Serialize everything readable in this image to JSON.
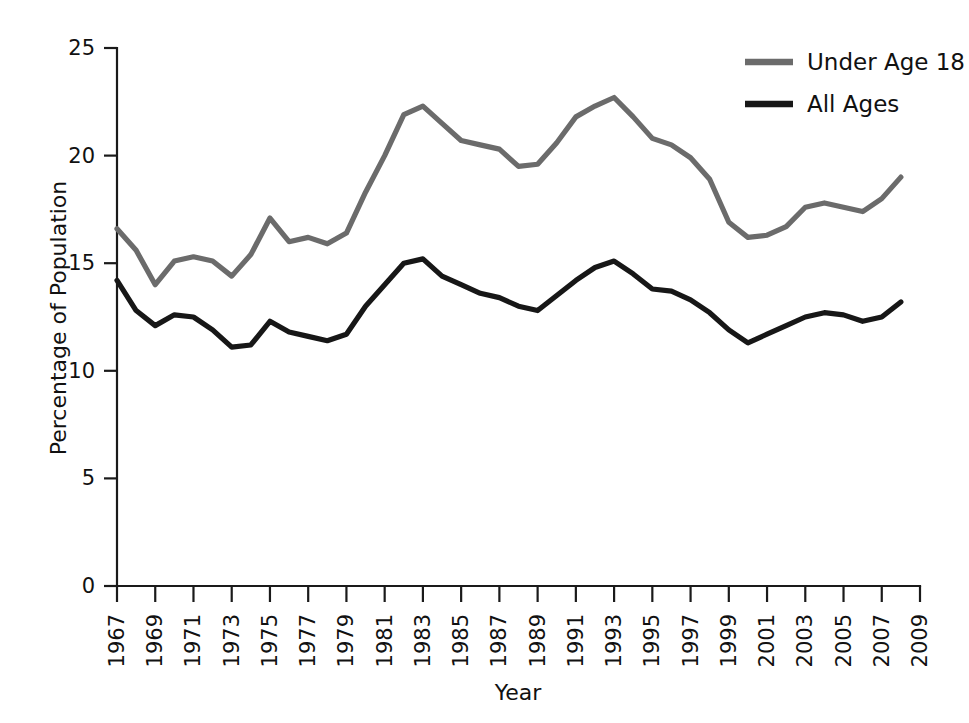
{
  "chart_data": {
    "type": "line",
    "title": "",
    "xlabel": "Year",
    "ylabel": "Percentage of Population",
    "ylim": [
      0,
      25
    ],
    "xlim": [
      1967,
      2009
    ],
    "yticks": [
      "0",
      "5",
      "10",
      "15",
      "20",
      "25"
    ],
    "ytick_values": [
      0,
      5,
      10,
      15,
      20,
      25
    ],
    "grid": false,
    "legend_position": "top-right",
    "x": [
      1967,
      1968,
      1969,
      1970,
      1971,
      1972,
      1973,
      1974,
      1975,
      1976,
      1977,
      1978,
      1979,
      1980,
      1981,
      1982,
      1983,
      1984,
      1985,
      1986,
      1987,
      1988,
      1989,
      1990,
      1991,
      1992,
      1993,
      1994,
      1995,
      1996,
      1997,
      1998,
      1999,
      2000,
      2001,
      2002,
      2003,
      2004,
      2005,
      2006,
      2007,
      2008
    ],
    "xtick_labels": [
      "1967",
      "1969",
      "1971",
      "1973",
      "1975",
      "1977",
      "1979",
      "1981",
      "1983",
      "1985",
      "1987",
      "1989",
      "1991",
      "1993",
      "1995",
      "1997",
      "1999",
      "2001",
      "2003",
      "2005",
      "2007",
      "2009"
    ],
    "series": [
      {
        "name": "Under Age 18",
        "color": "#6b6b6b",
        "values": [
          16.6,
          15.6,
          14.0,
          15.1,
          15.3,
          15.1,
          14.4,
          15.4,
          17.1,
          16.0,
          16.2,
          15.9,
          16.4,
          18.3,
          20.0,
          21.9,
          22.3,
          21.5,
          20.7,
          20.5,
          20.3,
          19.5,
          19.6,
          20.6,
          21.8,
          22.3,
          22.7,
          21.8,
          20.8,
          20.5,
          19.9,
          18.9,
          16.9,
          16.2,
          16.3,
          16.7,
          17.6,
          17.8,
          17.6,
          17.4,
          18.0,
          19.0
        ]
      },
      {
        "name": "All Ages",
        "color": "#171717",
        "values": [
          14.2,
          12.8,
          12.1,
          12.6,
          12.5,
          11.9,
          11.1,
          11.2,
          12.3,
          11.8,
          11.6,
          11.4,
          11.7,
          13.0,
          14.0,
          15.0,
          15.2,
          14.4,
          14.0,
          13.6,
          13.4,
          13.0,
          12.8,
          13.5,
          14.2,
          14.8,
          15.1,
          14.5,
          13.8,
          13.7,
          13.3,
          12.7,
          11.9,
          11.3,
          11.7,
          12.1,
          12.5,
          12.7,
          12.6,
          12.3,
          12.5,
          13.2
        ]
      }
    ]
  },
  "legend": {
    "entries": [
      {
        "label": "Under Age 18",
        "color": "#6b6b6b"
      },
      {
        "label": "All Ages",
        "color": "#171717"
      }
    ]
  },
  "axes": {
    "y_axis_title": "Percentage of Population",
    "x_axis_title": "Year"
  }
}
